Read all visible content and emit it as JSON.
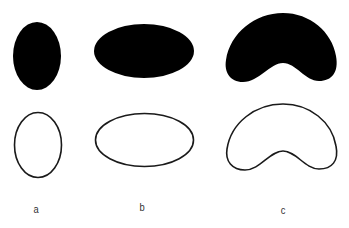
{
  "figure": {
    "colors": {
      "fill": "#000000",
      "stroke": "#1a1a1a",
      "background": "#ffffff",
      "label": "#333333"
    },
    "shapes": [
      {
        "id": "a",
        "kind": "ellipse",
        "label": "a"
      },
      {
        "id": "b",
        "kind": "ellipse",
        "label": "b"
      },
      {
        "id": "c",
        "kind": "kidney",
        "label": "c"
      }
    ],
    "rows": [
      "filled",
      "outline"
    ]
  }
}
